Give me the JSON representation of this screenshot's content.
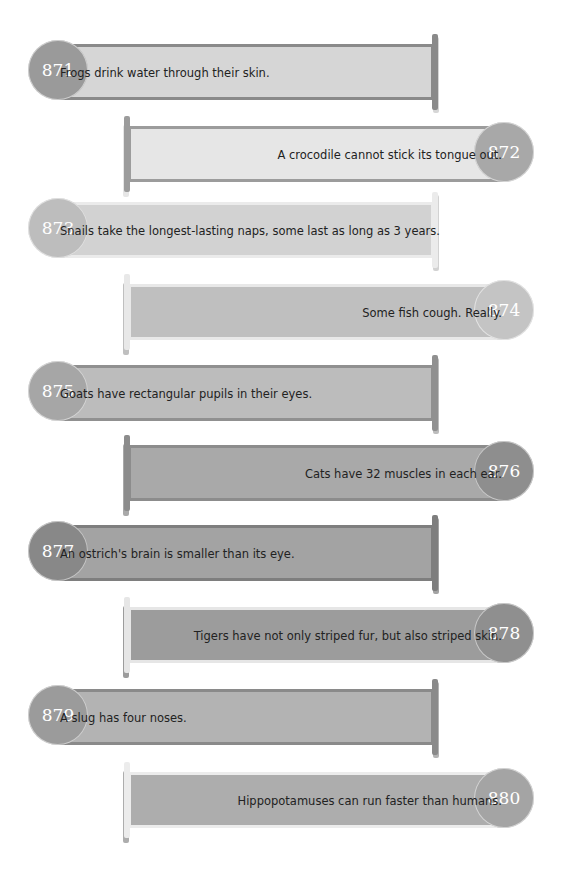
{
  "facts": [
    {
      "number": "871",
      "text": "Frogs drink water through their skin.",
      "align": "left",
      "band_color": "#d6d6d6",
      "border_color": "#8a8a8a",
      "badge_color": "#9a9a9a"
    },
    {
      "number": "872",
      "text": "A crocodile cannot stick its tongue out.",
      "align": "right",
      "band_color": "#e6e6e6",
      "border_color": "#9c9c9c",
      "badge_color": "#a8a8a8"
    },
    {
      "number": "873",
      "text": "Snails take the longest-lasting naps, some last as long as 3 years.",
      "align": "left",
      "band_color": "#d2d2d2",
      "border_color": "#ebebeb",
      "badge_color": "#bdbdbd"
    },
    {
      "number": "874",
      "text": "Some fish cough. Really.",
      "align": "right",
      "band_color": "#bfbfbf",
      "border_color": "#e8e8e8",
      "badge_color": "#c4c4c4"
    },
    {
      "number": "875",
      "text": "Goats have rectangular pupils in their eyes.",
      "align": "left",
      "band_color": "#bcbcbc",
      "border_color": "#909090",
      "badge_color": "#a6a6a6"
    },
    {
      "number": "876",
      "text": "Cats have 32 muscles in each ear.",
      "align": "right",
      "band_color": "#a9a9a9",
      "border_color": "#8c8c8c",
      "badge_color": "#8e8e8e"
    },
    {
      "number": "877",
      "text": "An ostrich's brain is smaller than its eye.",
      "align": "left",
      "band_color": "#a3a3a3",
      "border_color": "#7e7e7e",
      "badge_color": "#888888"
    },
    {
      "number": "878",
      "text": "Tigers have not only striped fur, but also striped skin.",
      "align": "right",
      "band_color": "#9c9c9c",
      "border_color": "#e6e6e6",
      "badge_color": "#8f8f8f"
    },
    {
      "number": "879",
      "text": "A slug has four noses.",
      "align": "left",
      "band_color": "#b3b3b3",
      "border_color": "#8a8a8a",
      "badge_color": "#9b9b9b"
    },
    {
      "number": "880",
      "text": "Hippopotamuses can run faster than humans.",
      "align": "right",
      "band_color": "#adadad",
      "border_color": "#ececec",
      "badge_color": "#a4a4a4"
    }
  ]
}
